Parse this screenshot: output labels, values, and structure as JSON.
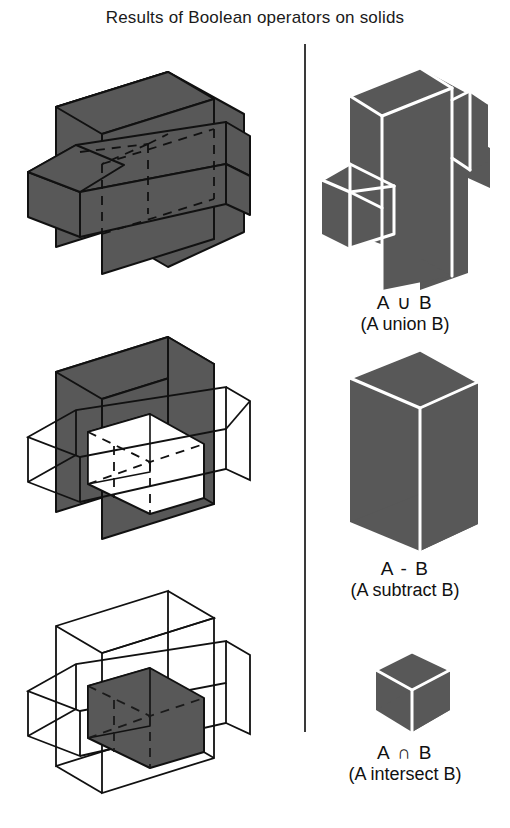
{
  "title": "Results of Boolean operators on solids",
  "colors": {
    "solid_fill": "#585858",
    "outline": "#111111",
    "edge_highlight": "#ffffff",
    "background": "#ffffff",
    "divider": "#3a3a3a",
    "text": "#111111"
  },
  "divider": {
    "name": "vertical-divider"
  },
  "left_column": {
    "figures": [
      {
        "id": "operands-union",
        "description": "Two intersecting solid boxes, both shaded, hidden edges dashed",
        "state": "both-solid"
      },
      {
        "id": "operands-subtract",
        "description": "Box A shaded, box B wireframe, overlap region shown hollow",
        "state": "a-solid-b-wire"
      },
      {
        "id": "operands-intersect",
        "description": "Both boxes wireframe, overlapping region shaded",
        "state": "both-wire-overlap-solid"
      }
    ]
  },
  "right_column": {
    "results": [
      {
        "id": "result-union",
        "operator": "A ∪ B",
        "caption": "(A union B)",
        "shape": "union-solid"
      },
      {
        "id": "result-subtract",
        "operator": "A - B",
        "caption": "(A subtract B)",
        "shape": "box-solid"
      },
      {
        "id": "result-intersect",
        "operator": "A ∩ B",
        "caption": "(A intersect B)",
        "shape": "cube-solid"
      }
    ]
  }
}
